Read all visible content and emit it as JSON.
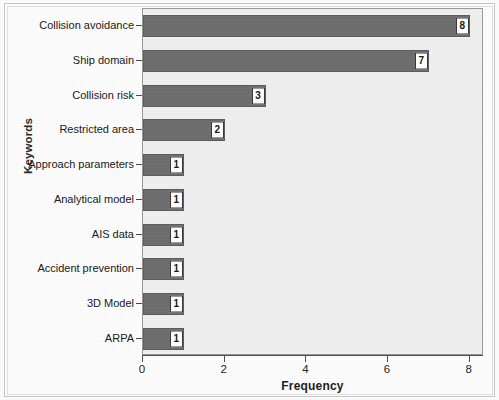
{
  "chart_data": {
    "type": "bar",
    "orientation": "horizontal",
    "title": "",
    "xlabel": "Frequency",
    "ylabel": "Keywords",
    "categories": [
      "Collision avoidance",
      "Ship domain",
      "Collision risk",
      "Restricted area",
      "Approach parameters",
      "Analytical model",
      "AIS data",
      "Accident prevention",
      "3D Model",
      "ARPA"
    ],
    "values": [
      8,
      7,
      3,
      2,
      1,
      1,
      1,
      1,
      1,
      1
    ],
    "data_labels": [
      "8",
      "7",
      "3",
      "2",
      "1",
      "1",
      "1",
      "1",
      "1",
      "1"
    ],
    "xlim": [
      0,
      8.3
    ],
    "xticks": [
      0,
      2,
      4,
      6,
      8
    ],
    "xticklabels": [
      "0",
      "2",
      "4",
      "6",
      "8"
    ],
    "grid": false,
    "legend": false,
    "colors": {
      "bar_fill": "#6f6f6f",
      "bar_edge": "#5e5e5e",
      "plot_background": "#f0f0f0",
      "figure_background": "#fdfdfd",
      "axis": "#4f4f4f",
      "text": "#1f1f1f",
      "label_box_fill": "#ffffff",
      "label_box_edge": "#3a3a3a"
    }
  }
}
